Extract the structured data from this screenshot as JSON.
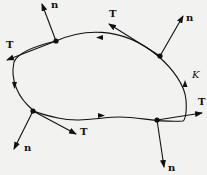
{
  "diagram": {
    "type": "closed-curve-with-frame-vectors",
    "curve_label": "K",
    "tangent_label": "T",
    "normal_label": "n",
    "points": [
      {
        "id": "upper-left",
        "tangent": "T",
        "normal": "n"
      },
      {
        "id": "upper-right",
        "tangent": "T",
        "normal": "n"
      },
      {
        "id": "lower-left",
        "tangent": "T",
        "normal": "n"
      },
      {
        "id": "lower-right",
        "tangent": "T",
        "normal": "n"
      }
    ],
    "colors": {
      "ink": "#111111",
      "background": "#f2f2f0"
    }
  }
}
